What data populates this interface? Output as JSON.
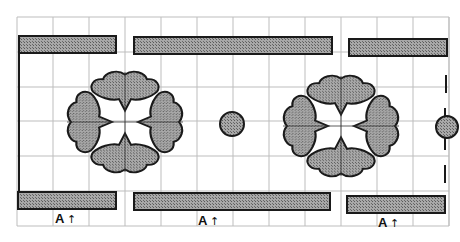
{
  "diagram": {
    "type": "pattern-layout",
    "colors": {
      "background": "#ffffff",
      "grid": "#bdbdbd",
      "outline": "#1a1a1a",
      "fill": "#9a9a9a",
      "hatch": "#6e6e6e"
    },
    "grid": {
      "left": 17,
      "top": 17,
      "right": 449,
      "bottom": 226,
      "spacing": 36
    },
    "top_bars": [
      {
        "x": 19,
        "y": 36,
        "w": 97,
        "h": 17
      },
      {
        "x": 134,
        "y": 37,
        "w": 198,
        "h": 17
      },
      {
        "x": 349,
        "y": 39,
        "w": 98,
        "h": 17
      }
    ],
    "bottom_bars": [
      {
        "x": 18,
        "y": 192,
        "w": 98,
        "h": 17
      },
      {
        "x": 134,
        "y": 193,
        "w": 196,
        "h": 17
      },
      {
        "x": 347,
        "y": 196,
        "w": 98,
        "h": 17
      }
    ],
    "flowers": [
      {
        "cx": 125,
        "cy": 122
      },
      {
        "cx": 341,
        "cy": 126
      }
    ],
    "circles": [
      {
        "cx": 232,
        "cy": 124,
        "r": 12
      },
      {
        "cx": 447,
        "cy": 127,
        "r": 11
      }
    ],
    "labels": [
      {
        "text": "A",
        "arrow": "↑",
        "x": 55,
        "y": 223
      },
      {
        "text": "A",
        "arrow": "↑",
        "x": 198,
        "y": 225
      },
      {
        "text": "A",
        "arrow": "↑",
        "x": 378,
        "y": 227
      }
    ]
  }
}
